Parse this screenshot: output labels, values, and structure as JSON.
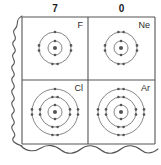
{
  "figure": {
    "kind": "periodic-table-fragment",
    "paper_color": "#ffffff",
    "line_color": "#555555",
    "text_color": "#1a1a1a",
    "electron_color": "#555555"
  },
  "columns": [
    {
      "id": "group-7",
      "label": "7"
    },
    {
      "id": "group-0",
      "label": "0"
    }
  ],
  "cells": [
    {
      "id": "fluorine",
      "symbol": "F",
      "column": "7",
      "row": 1,
      "nucleus": true,
      "shells": [
        {
          "radius": 7,
          "electrons": 2
        },
        {
          "radius": 16,
          "electrons": 7
        }
      ],
      "shell_counts": "2,7"
    },
    {
      "id": "neon",
      "symbol": "Ne",
      "column": "0",
      "row": 1,
      "nucleus": true,
      "shells": [
        {
          "radius": 7,
          "electrons": 2
        },
        {
          "radius": 16,
          "electrons": 8
        }
      ],
      "shell_counts": "2,8"
    },
    {
      "id": "chlorine",
      "symbol": "Cl",
      "column": "7",
      "row": 2,
      "nucleus": true,
      "shells": [
        {
          "radius": 7,
          "electrons": 2
        },
        {
          "radius": 15,
          "electrons": 8
        },
        {
          "radius": 23,
          "electrons": 7
        }
      ],
      "shell_counts": "2,8,7"
    },
    {
      "id": "argon",
      "symbol": "Ar",
      "column": "0",
      "row": 2,
      "nucleus": true,
      "shells": [
        {
          "radius": 7,
          "electrons": 2
        },
        {
          "radius": 15,
          "electrons": 8
        },
        {
          "radius": 23,
          "electrons": 8
        }
      ],
      "shell_counts": "2,8,8"
    }
  ],
  "edges": {
    "left": "wavy-torn",
    "bottom": "wavy-torn",
    "top": "straight",
    "right": "straight"
  }
}
